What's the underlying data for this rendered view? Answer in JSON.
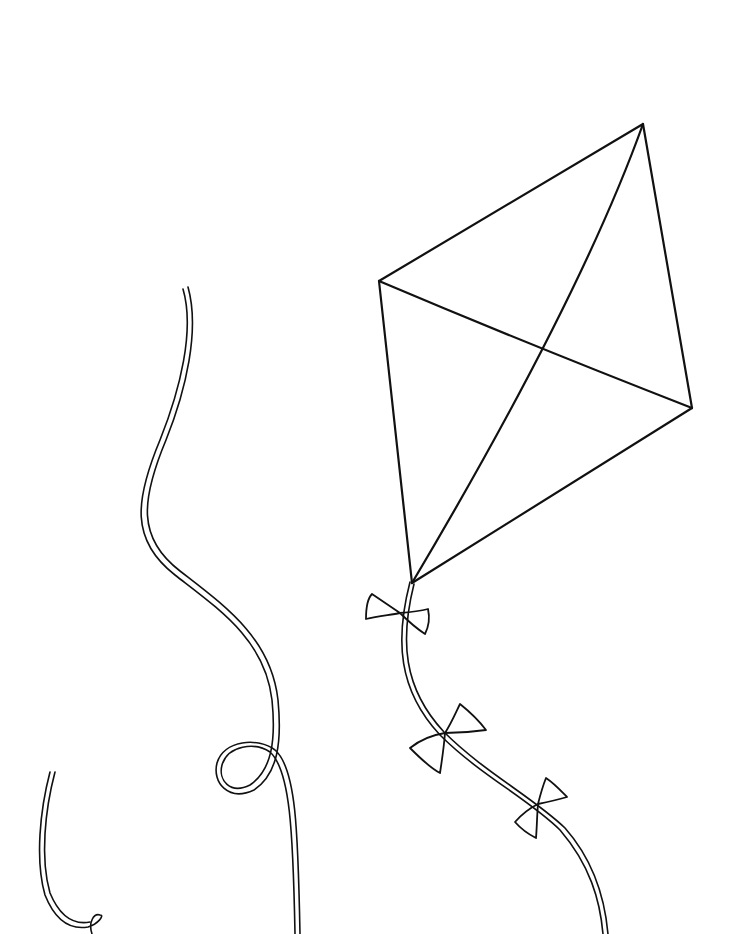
{
  "image": {
    "description": "Black and white line-art coloring page of a kite with a bowed tail and loose wavy strings",
    "background": "#ffffff",
    "ink": "#111111"
  },
  "elements": {
    "kite": {
      "label": "Diamond kite with cross spars"
    },
    "tail": {
      "label": "Kite tail with three bows",
      "bow_count": 3
    },
    "string_middle": {
      "label": "Wavy string with loop"
    },
    "string_left": {
      "label": "Short curved string with small loop"
    }
  }
}
